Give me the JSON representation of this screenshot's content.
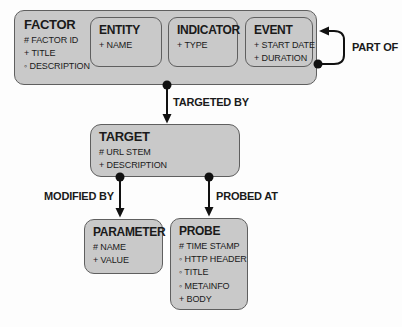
{
  "diagram": {
    "entities": [
      {
        "id": "factor",
        "title": "FACTOR",
        "attributes": [
          "# FACTOR ID",
          "+ TITLE",
          "◦ DESCRIPTION"
        ]
      },
      {
        "id": "entity",
        "title": "ENTITY",
        "attributes": [
          "+ NAME"
        ]
      },
      {
        "id": "indicator",
        "title": "INDICATOR",
        "attributes": [
          "+ TYPE"
        ]
      },
      {
        "id": "event",
        "title": "EVENT",
        "attributes": [
          "+ START DATE",
          "+ DURATION"
        ]
      },
      {
        "id": "target",
        "title": "TARGET",
        "attributes": [
          "# URL STEM",
          "+ DESCRIPTION"
        ]
      },
      {
        "id": "parameter",
        "title": "PARAMETER",
        "attributes": [
          "# NAME",
          "+ VALUE"
        ]
      },
      {
        "id": "probe",
        "title": "PROBE",
        "attributes": [
          "# TIME STAMP",
          "◦ HTTP HEADER",
          "◦ TITLE",
          "◦ METAINFO",
          "+ BODY"
        ]
      }
    ],
    "relationships": [
      {
        "label": "PART OF",
        "from": "factor",
        "to": "factor",
        "type": "self-loop"
      },
      {
        "label": "TARGETED BY",
        "from": "factor",
        "to": "target",
        "type": "arrow"
      },
      {
        "label": "MODIFIED BY",
        "from": "target",
        "to": "parameter",
        "type": "arrow"
      },
      {
        "label": "PROBED AT",
        "from": "target",
        "to": "probe",
        "type": "arrow"
      }
    ],
    "colors": {
      "box_fill": "#c9c9c9",
      "box_border": "#5f5f5f",
      "connector": "#111111",
      "text": "#1a1a1a",
      "background": "#fdfdfd"
    }
  }
}
